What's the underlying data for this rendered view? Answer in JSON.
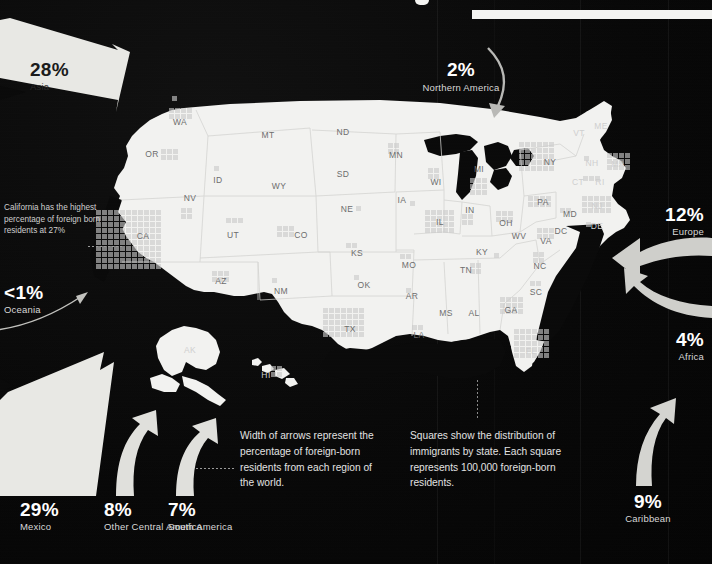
{
  "title_bar": {
    "visible": true
  },
  "arrows": [
    {
      "id": "asia",
      "pct": "28%",
      "region": "Asia",
      "style": "wedge-dark-text"
    },
    {
      "id": "northern-america",
      "pct": "2%",
      "region": "Northern America",
      "style": "thin-curve"
    },
    {
      "id": "europe",
      "pct": "12%",
      "region": "Europe",
      "style": "curve-left"
    },
    {
      "id": "africa",
      "pct": "4%",
      "region": "Africa",
      "style": "curve-left-thin"
    },
    {
      "id": "caribbean",
      "pct": "9%",
      "region": "Caribbean",
      "style": "curve-up"
    },
    {
      "id": "oceania",
      "pct": "<1%",
      "region": "Oceania",
      "style": "hairline-curve"
    },
    {
      "id": "mexico",
      "pct": "29%",
      "region": "Mexico",
      "style": "wide-up"
    },
    {
      "id": "other-central-america",
      "pct": "8%",
      "region": "Other Central America",
      "style": "narrow-up"
    },
    {
      "id": "south-america",
      "pct": "7%",
      "region": "South America",
      "style": "narrow-up"
    }
  ],
  "callout": {
    "text": "California has the highest percentage of foreign born residents at 27%"
  },
  "legend": {
    "arrows_note": "Width of arrows represent the percentage of foreign-born residents from each region of the world.",
    "squares_note": "Squares show the distribution of immigrants by state. Each square represents 100,000 foreign-born residents."
  },
  "map": {
    "state_labels": [
      {
        "abbr": "WA",
        "x": 180,
        "y": 122
      },
      {
        "abbr": "OR",
        "x": 152,
        "y": 154
      },
      {
        "abbr": "ID",
        "x": 218,
        "y": 180
      },
      {
        "abbr": "MT",
        "x": 268,
        "y": 135
      },
      {
        "abbr": "WY",
        "x": 279,
        "y": 186
      },
      {
        "abbr": "NV",
        "x": 190,
        "y": 198
      },
      {
        "abbr": "CA",
        "x": 143,
        "y": 236
      },
      {
        "abbr": "UT",
        "x": 233,
        "y": 235
      },
      {
        "abbr": "CO",
        "x": 301,
        "y": 235
      },
      {
        "abbr": "AZ",
        "x": 221,
        "y": 281
      },
      {
        "abbr": "NM",
        "x": 281,
        "y": 291
      },
      {
        "abbr": "ND",
        "x": 343,
        "y": 132
      },
      {
        "abbr": "SD",
        "x": 343,
        "y": 174
      },
      {
        "abbr": "NE",
        "x": 347,
        "y": 209
      },
      {
        "abbr": "KS",
        "x": 357,
        "y": 253
      },
      {
        "abbr": "OK",
        "x": 364,
        "y": 285
      },
      {
        "abbr": "TX",
        "x": 350,
        "y": 329
      },
      {
        "abbr": "MN",
        "x": 396,
        "y": 155
      },
      {
        "abbr": "IA",
        "x": 402,
        "y": 200
      },
      {
        "abbr": "MO",
        "x": 409,
        "y": 265
      },
      {
        "abbr": "AR",
        "x": 412,
        "y": 296
      },
      {
        "abbr": "LA",
        "x": 419,
        "y": 335
      },
      {
        "abbr": "WI",
        "x": 436,
        "y": 182
      },
      {
        "abbr": "IL",
        "x": 440,
        "y": 222
      },
      {
        "abbr": "MS",
        "x": 446,
        "y": 313
      },
      {
        "abbr": "AL",
        "x": 474,
        "y": 313
      },
      {
        "abbr": "TN",
        "x": 466,
        "y": 270
      },
      {
        "abbr": "KY",
        "x": 482,
        "y": 252
      },
      {
        "abbr": "MI",
        "x": 479,
        "y": 169
      },
      {
        "abbr": "IN",
        "x": 470,
        "y": 210
      },
      {
        "abbr": "OH",
        "x": 506,
        "y": 223
      },
      {
        "abbr": "WV",
        "x": 519,
        "y": 236
      },
      {
        "abbr": "VA",
        "x": 546,
        "y": 241
      },
      {
        "abbr": "NC",
        "x": 540,
        "y": 266
      },
      {
        "abbr": "SC",
        "x": 536,
        "y": 292
      },
      {
        "abbr": "GA",
        "x": 511,
        "y": 310
      },
      {
        "abbr": "FL",
        "x": 531,
        "y": 351
      },
      {
        "abbr": "PA",
        "x": 543,
        "y": 202
      },
      {
        "abbr": "NY",
        "x": 550,
        "y": 162
      },
      {
        "abbr": "VT",
        "x": 579,
        "y": 133
      },
      {
        "abbr": "ME",
        "x": 601,
        "y": 126
      },
      {
        "abbr": "NH",
        "x": 592,
        "y": 163
      },
      {
        "abbr": "MA",
        "x": 618,
        "y": 164
      },
      {
        "abbr": "CT",
        "x": 578,
        "y": 182
      },
      {
        "abbr": "RI",
        "x": 600,
        "y": 182
      },
      {
        "abbr": "NJ",
        "x": 597,
        "y": 206
      },
      {
        "abbr": "MD",
        "x": 570,
        "y": 214
      },
      {
        "abbr": "DE",
        "x": 597,
        "y": 226
      },
      {
        "abbr": "DC",
        "x": 561,
        "y": 231
      },
      {
        "abbr": "AK",
        "x": 190,
        "y": 350
      },
      {
        "abbr": "HI",
        "x": 266,
        "y": 375
      }
    ],
    "square_blocks": [
      {
        "state": "WA",
        "x": 169,
        "y": 108,
        "cols": 4,
        "rows": 2
      },
      {
        "state": "OR",
        "x": 161,
        "y": 149,
        "cols": 3,
        "rows": 2
      },
      {
        "state": "ID",
        "x": 214,
        "y": 166,
        "cols": 1,
        "rows": 1
      },
      {
        "state": "NV",
        "x": 181,
        "y": 208,
        "cols": 2,
        "rows": 2
      },
      {
        "state": "CA",
        "x": 96,
        "y": 210,
        "cols": 11,
        "rows": 10
      },
      {
        "state": "UT",
        "x": 226,
        "y": 218,
        "cols": 3,
        "rows": 1
      },
      {
        "state": "CO",
        "x": 277,
        "y": 226,
        "cols": 3,
        "rows": 2
      },
      {
        "state": "AZ",
        "x": 212,
        "y": 271,
        "cols": 3,
        "rows": 2
      },
      {
        "state": "NM",
        "x": 272,
        "y": 278,
        "cols": 1,
        "rows": 1
      },
      {
        "state": "NE",
        "x": 356,
        "y": 206,
        "cols": 1,
        "rows": 1
      },
      {
        "state": "KS",
        "x": 346,
        "y": 243,
        "cols": 2,
        "rows": 1
      },
      {
        "state": "OK",
        "x": 354,
        "y": 275,
        "cols": 1,
        "rows": 1
      },
      {
        "state": "TX",
        "x": 323,
        "y": 308,
        "cols": 7,
        "rows": 5
      },
      {
        "state": "MN",
        "x": 388,
        "y": 143,
        "cols": 2,
        "rows": 2
      },
      {
        "state": "IA",
        "x": 410,
        "y": 201,
        "cols": 1,
        "rows": 1
      },
      {
        "state": "MO",
        "x": 400,
        "y": 254,
        "cols": 2,
        "rows": 1
      },
      {
        "state": "AR",
        "x": 406,
        "y": 288,
        "cols": 1,
        "rows": 1
      },
      {
        "state": "LA",
        "x": 412,
        "y": 325,
        "cols": 2,
        "rows": 1
      },
      {
        "state": "WI",
        "x": 428,
        "y": 168,
        "cols": 2,
        "rows": 2
      },
      {
        "state": "IL",
        "x": 425,
        "y": 210,
        "cols": 5,
        "rows": 4
      },
      {
        "state": "MI",
        "x": 470,
        "y": 178,
        "cols": 3,
        "rows": 3
      },
      {
        "state": "IN",
        "x": 462,
        "y": 214,
        "cols": 2,
        "rows": 2
      },
      {
        "state": "OH",
        "x": 496,
        "y": 211,
        "cols": 3,
        "rows": 2
      },
      {
        "state": "TN",
        "x": 470,
        "y": 263,
        "cols": 2,
        "rows": 2
      },
      {
        "state": "KY",
        "x": 494,
        "y": 253,
        "cols": 1,
        "rows": 1
      },
      {
        "state": "VA",
        "x": 537,
        "y": 228,
        "cols": 3,
        "rows": 2
      },
      {
        "state": "NC",
        "x": 533,
        "y": 252,
        "cols": 2,
        "rows": 2
      },
      {
        "state": "SC",
        "x": 530,
        "y": 281,
        "cols": 2,
        "rows": 1
      },
      {
        "state": "GA",
        "x": 500,
        "y": 297,
        "cols": 4,
        "rows": 3
      },
      {
        "state": "FL",
        "x": 514,
        "y": 329,
        "cols": 6,
        "rows": 5
      },
      {
        "state": "PA",
        "x": 528,
        "y": 196,
        "cols": 4,
        "rows": 2
      },
      {
        "state": "NY",
        "x": 519,
        "y": 142,
        "cols": 6,
        "rows": 5
      },
      {
        "state": "MA",
        "x": 607,
        "y": 153,
        "cols": 4,
        "rows": 3
      },
      {
        "state": "NJ",
        "x": 582,
        "y": 196,
        "cols": 5,
        "rows": 3
      },
      {
        "state": "DE",
        "x": 586,
        "y": 222,
        "cols": 1,
        "rows": 1
      },
      {
        "state": "MD",
        "x": 560,
        "y": 208,
        "cols": 2,
        "rows": 1
      },
      {
        "state": "CT",
        "x": 583,
        "y": 176,
        "cols": 2,
        "rows": 1
      },
      {
        "state": "RI",
        "x": 595,
        "y": 176,
        "cols": 1,
        "rows": 1
      },
      {
        "state": "NH",
        "x": 584,
        "y": 156,
        "cols": 1,
        "rows": 1
      },
      {
        "state": "HI",
        "x": 271,
        "y": 366,
        "cols": 2,
        "rows": 2
      },
      {
        "state": "WA2",
        "x": 172,
        "y": 96,
        "cols": 1,
        "rows": 1
      }
    ]
  },
  "colors": {
    "background": "#0a0a0a",
    "land": "#f2f2f0",
    "square": "#c9c9c9",
    "arrow": "#d6d6d2",
    "text_light": "#ffffff",
    "text_dark": "#1b1b1b",
    "state_label": "#6d6d6d"
  }
}
